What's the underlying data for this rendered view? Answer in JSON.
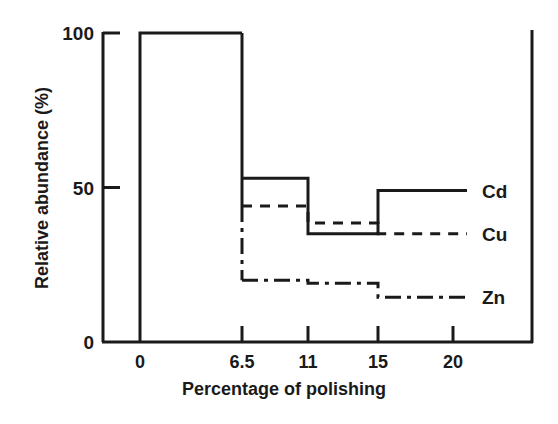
{
  "chart_data": {
    "type": "line",
    "subtype": "step",
    "title": "",
    "xlabel": "Percentage of polishing",
    "ylabel": "Relative abundance (%)",
    "x_ticks": [
      "0",
      "6.5",
      "11",
      "15",
      "20"
    ],
    "x_tick_values": [
      0,
      6.5,
      11,
      15,
      20
    ],
    "y_ticks": [
      "0",
      "50",
      "100"
    ],
    "y_tick_values": [
      0,
      50,
      100
    ],
    "ylim": [
      0,
      100
    ],
    "grid": false,
    "legend_position": "inline-right",
    "step_edges": [
      0,
      6.5,
      11,
      15,
      20
    ],
    "series": [
      {
        "name": "Cd",
        "linestyle": "solid",
        "values": [
          100,
          53,
          35,
          49
        ]
      },
      {
        "name": "Cu",
        "linestyle": "dashed",
        "values": [
          100,
          44,
          38.5,
          35
        ]
      },
      {
        "name": "Zn",
        "linestyle": "dashdot",
        "values": [
          100,
          20,
          19,
          14.5
        ]
      }
    ]
  },
  "colors": {
    "line": "#1a1a1a",
    "background": "#ffffff"
  }
}
